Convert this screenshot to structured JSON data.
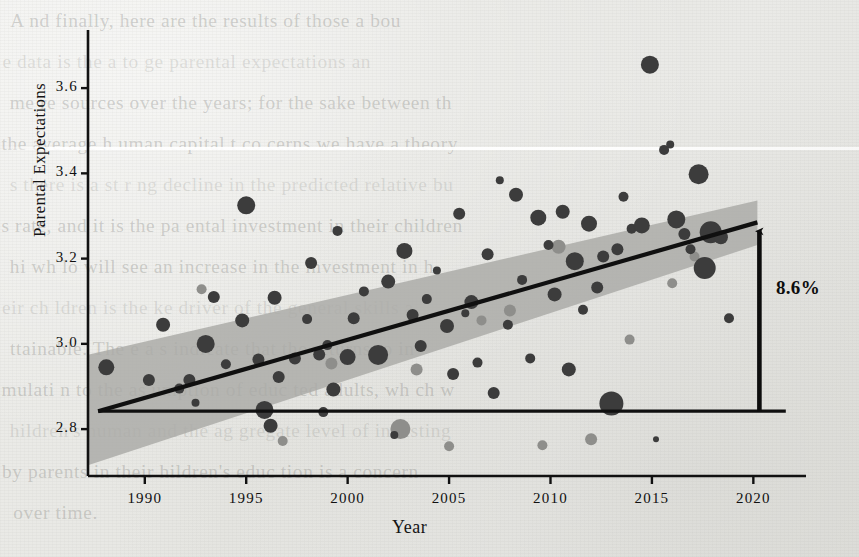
{
  "page": {
    "background_color": "#e9e9e6",
    "ink_color": "#141414",
    "bleed_through_lines": [
      "A  nd finally, here are the results of those a bou",
      "e data is the a to ge  parental expectations an",
      "me re sources over the years; for the sake between th",
      "the average h uman capital t co cerns we have a theory",
      "s  there is a st r ng decline in  the predicted relative bu",
      "s  rate,  and  it  is the  pa  ental investment in their children",
      "hi wh lo  will see an  increase  in  the investment  in  h",
      "eir ch ldren is  the  ke   driver  of  the  general skills a",
      "ttainable.  The   e a s   indicate  that   the  returns  to  in",
      "mulati n to the as umption of  educ ted adults, wh ch w",
      "hildren's  human and  the  ag gregate  level  of  investing",
      "by parents in  their  hildren's educ tion is  a concern",
      "over time."
    ]
  },
  "chart_data": {
    "type": "scatter",
    "title": "",
    "xlabel": "Year",
    "ylabel": "Parental Expectations",
    "xlim": [
      1987.2,
      2022.3
    ],
    "ylim": [
      2.69,
      3.68
    ],
    "xticks": [
      1990,
      1995,
      2000,
      2005,
      2010,
      2015,
      2020
    ],
    "xtick_labels": [
      "1990",
      "1995",
      "2000",
      "2005",
      "2010",
      "2015",
      "2020"
    ],
    "yticks": [
      2.8,
      3.0,
      3.2,
      3.4,
      3.6
    ],
    "ytick_labels": [
      "2.8",
      "3.0",
      "3.2",
      "3.4",
      "3.6"
    ],
    "grid": false,
    "legend": "none",
    "marker": "bubble",
    "marker_size_meaning": "sample size / survey weight",
    "series": [
      {
        "name": "Survey cohorts (dark)",
        "color": "#3c3c3c",
        "points": [
          {
            "x": 1988.1,
            "y": 2.945,
            "r": 8
          },
          {
            "x": 1990.2,
            "y": 2.915,
            "r": 6
          },
          {
            "x": 1990.9,
            "y": 3.045,
            "r": 7
          },
          {
            "x": 1991.7,
            "y": 2.895,
            "r": 5
          },
          {
            "x": 1992.2,
            "y": 2.915,
            "r": 6
          },
          {
            "x": 1992.5,
            "y": 2.862,
            "r": 4
          },
          {
            "x": 1993.0,
            "y": 3.0,
            "r": 9
          },
          {
            "x": 1993.4,
            "y": 3.11,
            "r": 6
          },
          {
            "x": 1994.0,
            "y": 2.952,
            "r": 5
          },
          {
            "x": 1994.8,
            "y": 3.055,
            "r": 7
          },
          {
            "x": 1995.0,
            "y": 3.325,
            "r": 9
          },
          {
            "x": 1995.6,
            "y": 2.963,
            "r": 6
          },
          {
            "x": 1995.9,
            "y": 2.845,
            "r": 9
          },
          {
            "x": 1996.2,
            "y": 2.808,
            "r": 7
          },
          {
            "x": 1996.4,
            "y": 3.108,
            "r": 7
          },
          {
            "x": 1996.6,
            "y": 2.922,
            "r": 6
          },
          {
            "x": 1997.4,
            "y": 2.966,
            "r": 6
          },
          {
            "x": 1998.0,
            "y": 3.058,
            "r": 5
          },
          {
            "x": 1998.2,
            "y": 3.19,
            "r": 6
          },
          {
            "x": 1998.6,
            "y": 2.975,
            "r": 6
          },
          {
            "x": 1998.8,
            "y": 2.84,
            "r": 5
          },
          {
            "x": 1999.0,
            "y": 2.997,
            "r": 5
          },
          {
            "x": 1999.3,
            "y": 2.893,
            "r": 7
          },
          {
            "x": 1999.5,
            "y": 3.265,
            "r": 5
          },
          {
            "x": 2000.0,
            "y": 2.969,
            "r": 8
          },
          {
            "x": 2000.3,
            "y": 3.06,
            "r": 6
          },
          {
            "x": 2000.8,
            "y": 3.123,
            "r": 5
          },
          {
            "x": 2001.5,
            "y": 2.974,
            "r": 10
          },
          {
            "x": 2002.0,
            "y": 3.146,
            "r": 7
          },
          {
            "x": 2002.3,
            "y": 2.786,
            "r": 4
          },
          {
            "x": 2002.8,
            "y": 3.218,
            "r": 8
          },
          {
            "x": 2003.2,
            "y": 3.068,
            "r": 6
          },
          {
            "x": 2003.6,
            "y": 2.995,
            "r": 6
          },
          {
            "x": 2003.9,
            "y": 3.105,
            "r": 5
          },
          {
            "x": 2004.4,
            "y": 3.172,
            "r": 4
          },
          {
            "x": 2004.9,
            "y": 3.042,
            "r": 7
          },
          {
            "x": 2005.2,
            "y": 2.929,
            "r": 6
          },
          {
            "x": 2005.5,
            "y": 3.305,
            "r": 6
          },
          {
            "x": 2005.8,
            "y": 3.072,
            "r": 4
          },
          {
            "x": 2006.1,
            "y": 3.098,
            "r": 7
          },
          {
            "x": 2006.4,
            "y": 2.956,
            "r": 5
          },
          {
            "x": 2006.9,
            "y": 3.21,
            "r": 6
          },
          {
            "x": 2007.2,
            "y": 2.885,
            "r": 6
          },
          {
            "x": 2007.5,
            "y": 3.384,
            "r": 4
          },
          {
            "x": 2007.9,
            "y": 3.045,
            "r": 5
          },
          {
            "x": 2008.3,
            "y": 3.35,
            "r": 7
          },
          {
            "x": 2008.6,
            "y": 3.15,
            "r": 5
          },
          {
            "x": 2009.0,
            "y": 2.966,
            "r": 5
          },
          {
            "x": 2009.4,
            "y": 3.296,
            "r": 8
          },
          {
            "x": 2009.9,
            "y": 3.232,
            "r": 5
          },
          {
            "x": 2010.2,
            "y": 3.116,
            "r": 7
          },
          {
            "x": 2010.6,
            "y": 3.31,
            "r": 7
          },
          {
            "x": 2010.9,
            "y": 2.94,
            "r": 7
          },
          {
            "x": 2011.2,
            "y": 3.194,
            "r": 9
          },
          {
            "x": 2011.6,
            "y": 3.08,
            "r": 5
          },
          {
            "x": 2011.9,
            "y": 3.282,
            "r": 8
          },
          {
            "x": 2012.3,
            "y": 3.132,
            "r": 6
          },
          {
            "x": 2012.6,
            "y": 3.205,
            "r": 6
          },
          {
            "x": 2013.0,
            "y": 2.86,
            "r": 12
          },
          {
            "x": 2013.3,
            "y": 3.222,
            "r": 6
          },
          {
            "x": 2013.6,
            "y": 3.345,
            "r": 5
          },
          {
            "x": 2014.0,
            "y": 3.27,
            "r": 5
          },
          {
            "x": 2014.5,
            "y": 3.278,
            "r": 8
          },
          {
            "x": 2014.9,
            "y": 3.655,
            "r": 9
          },
          {
            "x": 2015.2,
            "y": 2.776,
            "r": 3
          },
          {
            "x": 2015.6,
            "y": 3.455,
            "r": 5
          },
          {
            "x": 2015.9,
            "y": 3.468,
            "r": 4
          },
          {
            "x": 2016.2,
            "y": 3.292,
            "r": 9
          },
          {
            "x": 2016.6,
            "y": 3.258,
            "r": 6
          },
          {
            "x": 2016.9,
            "y": 3.222,
            "r": 5
          },
          {
            "x": 2017.3,
            "y": 3.398,
            "r": 10
          },
          {
            "x": 2017.6,
            "y": 3.178,
            "r": 11
          },
          {
            "x": 2017.9,
            "y": 3.262,
            "r": 11
          },
          {
            "x": 2018.4,
            "y": 3.25,
            "r": 7
          },
          {
            "x": 2018.8,
            "y": 3.06,
            "r": 5
          }
        ]
      },
      {
        "name": "Survey cohorts (light)",
        "color": "#8e8e8b",
        "points": [
          {
            "x": 1992.8,
            "y": 3.128,
            "r": 5
          },
          {
            "x": 1996.8,
            "y": 2.772,
            "r": 5
          },
          {
            "x": 1999.2,
            "y": 2.954,
            "r": 6
          },
          {
            "x": 2002.6,
            "y": 2.8,
            "r": 10
          },
          {
            "x": 2003.4,
            "y": 2.94,
            "r": 6
          },
          {
            "x": 2005.0,
            "y": 2.76,
            "r": 5
          },
          {
            "x": 2006.6,
            "y": 3.055,
            "r": 5
          },
          {
            "x": 2008.0,
            "y": 3.078,
            "r": 6
          },
          {
            "x": 2009.6,
            "y": 2.762,
            "r": 5
          },
          {
            "x": 2010.4,
            "y": 3.228,
            "r": 7
          },
          {
            "x": 2012.0,
            "y": 2.776,
            "r": 6
          },
          {
            "x": 2013.9,
            "y": 3.01,
            "r": 5
          },
          {
            "x": 2016.0,
            "y": 3.142,
            "r": 5
          },
          {
            "x": 2017.1,
            "y": 3.205,
            "r": 5
          }
        ]
      }
    ],
    "trend_line": {
      "label": "OLS fit",
      "color": "#101010",
      "x_start": 1987.7,
      "y_start": 2.842,
      "x_end": 2020.2,
      "y_end": 3.285
    },
    "confidence_band": {
      "label": "95% CI",
      "color": "#a8a8a5",
      "x_start": 1987.7,
      "x_end": 2020.2,
      "y_lower_start": 2.723,
      "y_upper_start": 2.98,
      "y_lower_end": 3.232,
      "y_upper_end": 3.336
    },
    "reference_line": {
      "label": "baseline",
      "color": "#101010",
      "y": 2.842,
      "x_start": 1987.7,
      "x_end": 2021.6
    },
    "annotation": {
      "text": "8.6%",
      "arrow": "up",
      "x": 2020.2,
      "y_from": 2.842,
      "y_to": 3.285
    }
  }
}
